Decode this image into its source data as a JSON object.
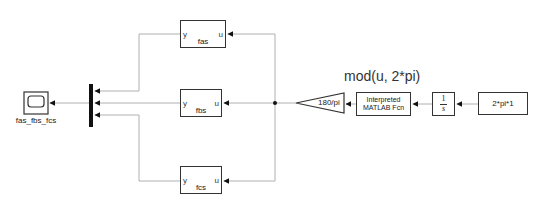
{
  "diagram": {
    "type": "simulink-model",
    "colors": {
      "wire": "#b0b0b0",
      "block_border": "#333333",
      "mux_fill": "#111111",
      "text": "#222222"
    },
    "blocks": {
      "scope": {
        "label": "fas_fbs_fcs",
        "kind": "Scope"
      },
      "mux": {
        "kind": "Mux",
        "inputs": 3
      },
      "fas": {
        "label": "fas",
        "kind": "MATLAB Function",
        "in_port": "u",
        "out_port": "y"
      },
      "fbs": {
        "label": "fbs",
        "kind": "MATLAB Function",
        "in_port": "u",
        "out_port": "y"
      },
      "fcs": {
        "label": "fcs",
        "kind": "MATLAB Function",
        "in_port": "u",
        "out_port": "y"
      },
      "gain": {
        "value": "180/pi",
        "kind": "Gain"
      },
      "interp": {
        "line1": "Interpreted",
        "line2": "MATLAB Fcn",
        "annotation": "mod(u, 2*pi)",
        "kind": "Interpreted MATLAB Function"
      },
      "integrator": {
        "numerator": "1",
        "denominator": "s",
        "kind": "Integrator"
      },
      "constant": {
        "value": "2*pi*1",
        "kind": "Constant"
      }
    },
    "connections": [
      {
        "from": "constant",
        "to": "integrator"
      },
      {
        "from": "integrator",
        "to": "interp"
      },
      {
        "from": "interp",
        "to": "gain"
      },
      {
        "from": "gain",
        "to": "fas"
      },
      {
        "from": "gain",
        "to": "fbs"
      },
      {
        "from": "gain",
        "to": "fcs"
      },
      {
        "from": "fas",
        "to": "mux.1"
      },
      {
        "from": "fbs",
        "to": "mux.2"
      },
      {
        "from": "fcs",
        "to": "mux.3"
      },
      {
        "from": "mux",
        "to": "scope"
      }
    ]
  }
}
